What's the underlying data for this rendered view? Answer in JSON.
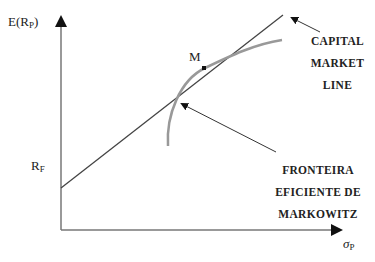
{
  "diagram": {
    "y_axis_label": "E(R",
    "y_axis_sub": "P",
    "y_axis_close": ")",
    "x_axis_label": "σ",
    "x_axis_sub": "P",
    "rf_label": "R",
    "rf_sub": "F",
    "market_portfolio_label": "M",
    "cml_label": [
      "CAPITAL",
      "MARKET",
      "LINE"
    ],
    "frontier_label": [
      "FRONTEIRA",
      "EFICIENTE DE",
      "MARKOWITZ"
    ],
    "colors": {
      "axis": "#777777",
      "cml": "#444444",
      "frontier": "#999999",
      "text": "#222222"
    }
  }
}
